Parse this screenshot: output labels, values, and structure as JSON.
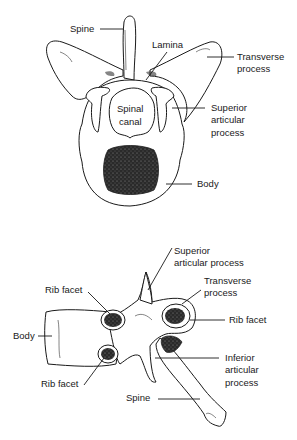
{
  "figure": {
    "top_view": {
      "name": "superior-view-vertebra",
      "labels": {
        "spine": "Spine",
        "lamina": "Lamina",
        "transverse_process_1": "Transverse",
        "transverse_process_2": "process",
        "spinal_canal_1": "Spinal",
        "spinal_canal_2": "canal",
        "superior_articular_1": "Superior",
        "superior_articular_2": "articular",
        "superior_articular_3": "process",
        "body": "Body"
      }
    },
    "side_view": {
      "name": "lateral-view-thoracic-vertebra",
      "labels": {
        "superior_articular_1": "Superior",
        "superior_articular_2": "articular process",
        "transverse_process_1": "Transverse",
        "transverse_process_2": "process",
        "rib_facet_upper_left": "Rib facet",
        "rib_facet_right": "Rib facet",
        "body": "Body",
        "inferior_articular_1": "Inferior",
        "inferior_articular_2": "articular",
        "inferior_articular_3": "process",
        "rib_facet_lower_left": "Rib facet",
        "spine": "Spine"
      }
    },
    "colors": {
      "ink": "#1a1a1a",
      "shading": "#333333",
      "background": "#ffffff"
    }
  }
}
